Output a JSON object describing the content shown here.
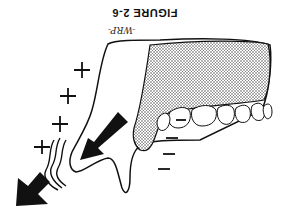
{
  "figure": {
    "title": "FIGURE 2-6",
    "signature": "-WRP-",
    "orientation": "rotated 180 degrees",
    "plus_signs": [
      "+",
      "+",
      "+",
      "+"
    ],
    "minus_signs": [
      "–",
      "–",
      "–",
      "–"
    ],
    "colors": {
      "ink": "#111111",
      "background": "#ffffff",
      "stipple": "#9a9a9a"
    }
  }
}
